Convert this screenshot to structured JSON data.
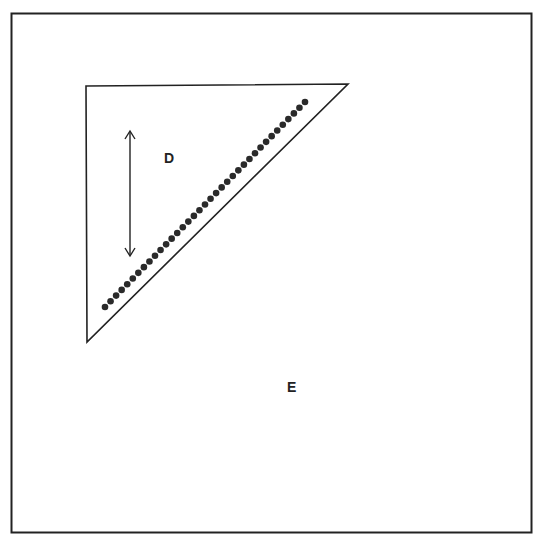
{
  "diagram": {
    "outer_region": {
      "label": "E",
      "box": [
        11,
        13,
        532,
        533
      ]
    },
    "inner_region": {
      "label": "D",
      "shape": "right-triangle",
      "vertices": [
        [
          86,
          86
        ],
        [
          348,
          84
        ],
        [
          87,
          342
        ]
      ]
    },
    "dot_line": {
      "start": [
        105,
        307
      ],
      "end": [
        305,
        102
      ],
      "count": 37,
      "color": "#2a2a2a"
    },
    "arrow": {
      "type": "double-headed",
      "x": 130,
      "y1": 131,
      "y2": 256
    },
    "colors": {
      "stroke": "#222222",
      "background": "#ffffff"
    }
  }
}
